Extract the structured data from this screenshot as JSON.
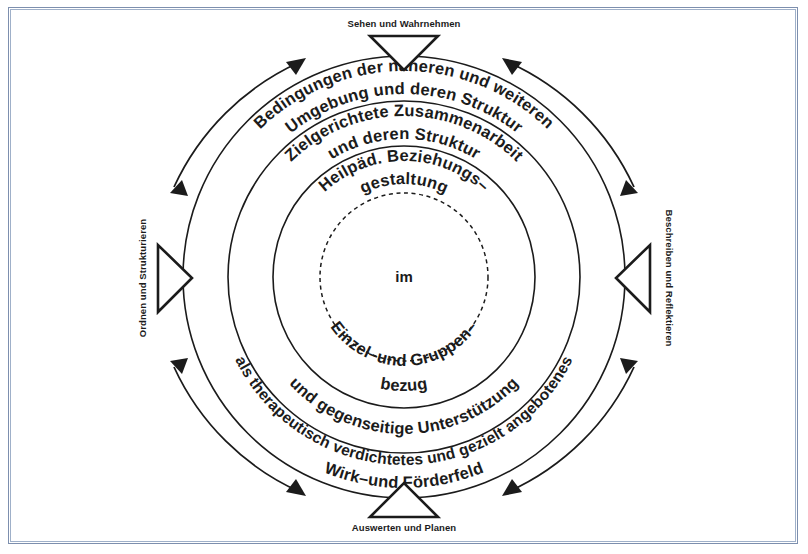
{
  "figure": {
    "background_color": "#ffffff",
    "ink_color": "#1b1b1b",
    "frame_color": "#7d8fae",
    "center_x": 404,
    "center_y": 277
  },
  "axis_labels": {
    "top": "Sehen und Wahrnehmen",
    "right": "Beschreiben und Reflektieren",
    "bottom": "Auswerten und Planen",
    "left": "Ordnen und Strukturieren"
  },
  "rings": [
    {
      "id": "ring-outer",
      "radius": 221,
      "style": "solid",
      "top_lines": [
        "Bedingungen der näheren und weiteren",
        "Umgebung und deren Struktur"
      ],
      "bottom_lines": [
        "als therapeutisch verdichtetes und gezielt angebotenes",
        "Wirk–und Förderfeld"
      ]
    },
    {
      "id": "ring-middle",
      "radius": 176,
      "style": "solid",
      "top_lines": [
        "Zielgerichtete Zusammenarbeit",
        "und deren Struktur"
      ],
      "bottom_lines": [
        "und gegenseitige Unterstützung"
      ]
    },
    {
      "id": "ring-inner",
      "radius": 131,
      "style": "solid",
      "top_lines": [
        "Heilpäd. Beziehungs–",
        "gestaltung"
      ],
      "bottom_lines": [
        "Einzel–und Gruppen–",
        "bezug"
      ]
    },
    {
      "id": "ring-core",
      "radius": 84,
      "style": "dashed",
      "top_lines": [],
      "bottom_lines": []
    }
  ],
  "center": {
    "label": "im"
  },
  "arrows": {
    "count": 4,
    "type": "double-headed-curved",
    "description": "Doppelpfeile zwischen den vier Achsenpunkten"
  }
}
